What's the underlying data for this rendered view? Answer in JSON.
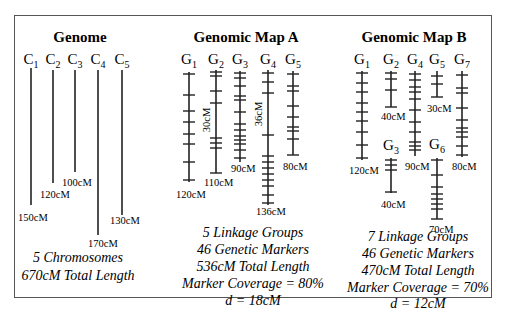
{
  "figure": {
    "frame_color": "#555555",
    "ink_color": "#222222"
  },
  "panels": [
    {
      "id": "genome",
      "title": "Genome",
      "title_x": 80,
      "groups": [
        {
          "label": "C",
          "sub": "1",
          "x": 31,
          "top": 68,
          "bottom": 205,
          "length_label": "150cM",
          "len_x": 18,
          "len_y": 221,
          "ticks": []
        },
        {
          "label": "C",
          "sub": "2",
          "x": 53,
          "top": 70,
          "bottom": 183,
          "length_label": "120cM",
          "len_x": 40,
          "len_y": 198,
          "ticks": []
        },
        {
          "label": "C",
          "sub": "3",
          "x": 75,
          "top": 70,
          "bottom": 172,
          "length_label": "100cM",
          "len_x": 62,
          "len_y": 186,
          "ticks": []
        },
        {
          "label": "C",
          "sub": "4",
          "x": 98,
          "top": 70,
          "bottom": 235,
          "length_label": "170cM",
          "len_x": 88,
          "len_y": 247,
          "ticks": []
        },
        {
          "label": "C",
          "sub": "5",
          "x": 122,
          "top": 70,
          "bottom": 215,
          "length_label": "130cM",
          "len_x": 110,
          "len_y": 224,
          "ticks": []
        }
      ],
      "summary": [
        "5 Chromosomes",
        "670cM Total Length"
      ],
      "summary_x": 78,
      "summary_y": [
        262,
        280
      ]
    },
    {
      "id": "map-a",
      "title": "Genomic Map A",
      "title_x": 246,
      "groups": [
        {
          "label": "G",
          "sub": "1",
          "x": 189,
          "top": 72,
          "bottom": 182,
          "length_label": "120cM",
          "len_x": 176,
          "len_y": 198,
          "ticks": [
            74,
            95,
            111,
            122,
            134,
            144,
            162,
            180
          ]
        },
        {
          "label": "G",
          "sub": "2",
          "x": 216,
          "top": 70,
          "bottom": 173,
          "length_label": "110cM",
          "len_x": 204,
          "len_y": 186,
          "ticks": [
            72,
            76,
            91,
            103,
            138,
            143,
            148,
            173
          ],
          "interval_label": "30cM",
          "interval_x": 210,
          "interval_y": 120
        },
        {
          "label": "G",
          "sub": "3",
          "x": 240,
          "top": 71,
          "bottom": 162,
          "length_label": "90cM",
          "len_x": 231,
          "len_y": 172,
          "ticks": [
            73,
            78,
            86,
            96,
            100,
            112,
            124,
            130,
            136,
            140,
            144,
            150,
            158
          ]
        },
        {
          "label": "G",
          "sub": "4",
          "x": 268,
          "top": 70,
          "bottom": 205,
          "length_label": "136cM",
          "len_x": 256,
          "len_y": 215,
          "ticks": [
            73,
            82,
            93,
            135,
            156,
            162,
            168,
            174,
            180,
            186,
            195,
            203
          ],
          "interval_label": "36cM",
          "interval_x": 262,
          "interval_y": 114
        },
        {
          "label": "G",
          "sub": "5",
          "x": 293,
          "top": 71,
          "bottom": 155,
          "length_label": "80cM",
          "len_x": 283,
          "len_y": 170,
          "ticks": [
            74,
            86,
            91,
            106,
            117,
            127,
            131,
            139,
            155
          ]
        }
      ],
      "summary": [
        "5 Linkage Groups",
        "46 Genetic Markers",
        "536cM Total Length",
        "Marker Coverage = 80%",
        "d = 18cM"
      ],
      "summary_x": 253,
      "summary_y": [
        237,
        254,
        271,
        288,
        305
      ]
    },
    {
      "id": "map-b",
      "title": "Genomic Map B",
      "title_x": 414,
      "groups": [
        {
          "label": "G",
          "sub": "1",
          "x": 362,
          "top": 71,
          "bottom": 160,
          "length_label": "120cM",
          "len_x": 349,
          "len_y": 174,
          "ticks": [
            73,
            83,
            92,
            103,
            112,
            121,
            132,
            145,
            158
          ]
        },
        {
          "label": "G",
          "sub": "2",
          "x": 391,
          "top": 71,
          "bottom": 107,
          "length_label": "40cM",
          "len_x": 381,
          "len_y": 120,
          "ticks": [
            73,
            79,
            90,
            107
          ]
        },
        {
          "label": "G",
          "sub": "3",
          "x": 391,
          "top": 158,
          "bottom": 193,
          "length_label": "40cM",
          "len_x": 381,
          "len_y": 208,
          "ticks": [
            160,
            165,
            170,
            192
          ],
          "label_y": 150
        },
        {
          "label": "G",
          "sub": "4",
          "x": 415,
          "top": 71,
          "bottom": 156,
          "length_label": "90cM",
          "len_x": 405,
          "len_y": 170,
          "ticks": [
            74,
            80,
            87,
            92,
            99,
            110,
            122,
            132,
            142,
            146,
            150
          ]
        },
        {
          "label": "G",
          "sub": "5",
          "x": 437,
          "top": 71,
          "bottom": 97,
          "length_label": "30cM",
          "len_x": 427,
          "len_y": 112,
          "ticks": [
            76,
            84,
            97
          ]
        },
        {
          "label": "G",
          "sub": "6",
          "x": 437,
          "top": 158,
          "bottom": 219,
          "length_label": "70cM",
          "len_x": 429,
          "len_y": 233,
          "ticks": [
            160,
            175,
            187,
            194,
            199,
            204,
            209,
            219
          ],
          "label_y": 149
        },
        {
          "label": "G",
          "sub": "7",
          "x": 462,
          "top": 71,
          "bottom": 157,
          "length_label": "80cM",
          "len_x": 452,
          "len_y": 170,
          "ticks": [
            75,
            88,
            93,
            108,
            120,
            128,
            132,
            137,
            146,
            155
          ]
        }
      ],
      "summary": [
        "7 Linkage Groups",
        "46 Genetic Markers",
        "470cM Total Length",
        "Marker Coverage = 70%",
        "d = 12cM"
      ],
      "summary_x": 418,
      "summary_y": [
        241,
        258,
        275,
        292,
        308
      ]
    }
  ]
}
